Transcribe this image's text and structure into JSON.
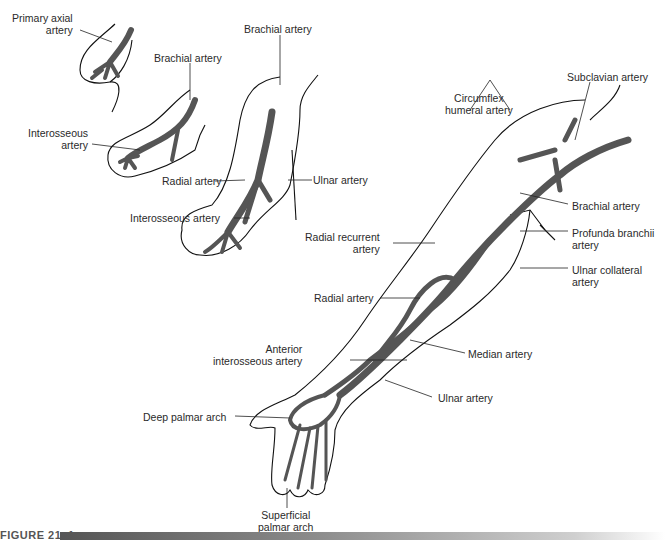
{
  "figure": {
    "caption": "FIGURE 21–1",
    "colors": {
      "artery": "#555555",
      "outline": "#111111",
      "caption_bar_start": "#555555",
      "caption_bar_end": "#ffffff"
    }
  },
  "panels": [
    {
      "id": "stage-1",
      "labels": [
        "Primary axial artery"
      ]
    },
    {
      "id": "stage-2",
      "labels": [
        "Brachial artery",
        "Interosseous artery",
        "Radial artery"
      ]
    },
    {
      "id": "stage-3",
      "labels": [
        "Brachial artery",
        "Ulnar artery",
        "Interosseous artery"
      ]
    },
    {
      "id": "adult-arm",
      "labels": [
        "Subclavian artery",
        "Circumflex humeral artery",
        "Brachial artery",
        "Profunda branchii artery",
        "Ulnar collateral artery",
        "Radial recurrent artery",
        "Radial artery",
        "Anterior interosseous artery",
        "Median artery",
        "Ulnar artery",
        "Deep palmar arch",
        "Superficial palmar arch"
      ]
    }
  ],
  "labels": {
    "primary_axial_1": "Primary axial",
    "primary_axial_2": "artery",
    "brachial_s2": "Brachial artery",
    "interosseous_s2_1": "Interosseous",
    "interosseous_s2_2": "artery",
    "radial_s2": "Radial artery",
    "brachial_s3": "Brachial artery",
    "ulnar_s3": "Ulnar artery",
    "interosseous_s3": "Interosseous artery",
    "subclavian": "Subclavian artery",
    "circumflex_1": "Circumflex",
    "circumflex_2": "humeral artery",
    "brachial_adult": "Brachial artery",
    "profunda_1": "Profunda branchii",
    "profunda_2": "artery",
    "ulnar_collateral_1": "Ulnar collateral",
    "ulnar_collateral_2": "artery",
    "radial_recurrent_1": "Radial recurrent",
    "radial_recurrent_2": "artery",
    "radial_adult": "Radial artery",
    "anterior_interosseous_1": "Anterior",
    "anterior_interosseous_2": "interosseous artery",
    "median": "Median artery",
    "ulnar_adult": "Ulnar artery",
    "deep_palmar": "Deep palmar arch",
    "superficial_palmar_1": "Superficial",
    "superficial_palmar_2": "palmar arch"
  }
}
